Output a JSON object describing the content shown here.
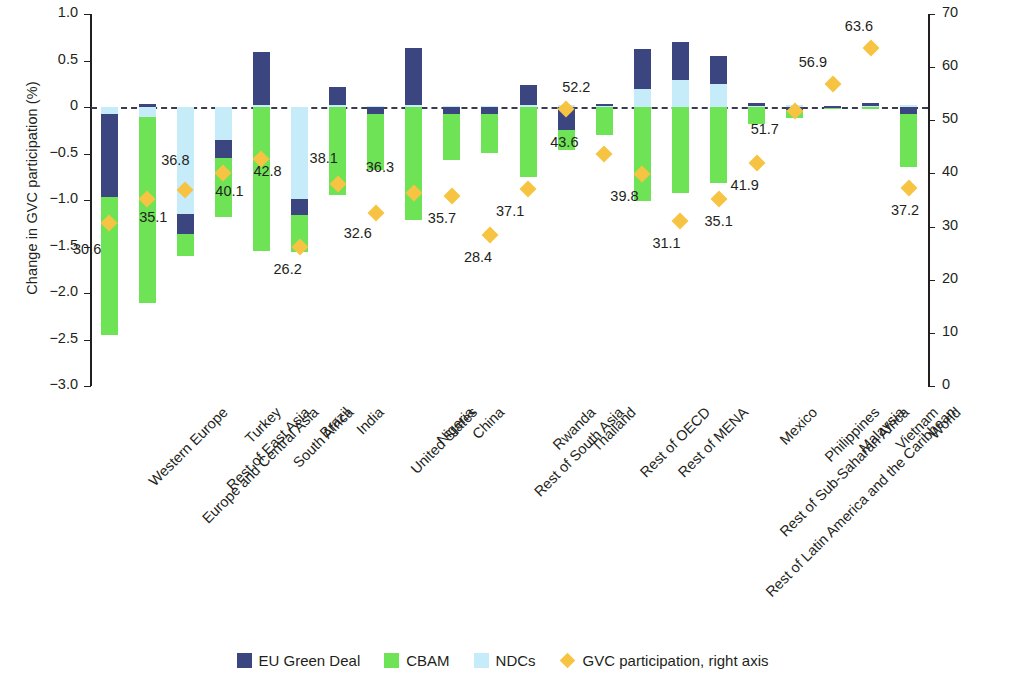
{
  "chart_data": {
    "type": "bar",
    "title": "",
    "subtitle": "",
    "ylabel": "Change in GVC participation (%)",
    "ylabel_right": "GVC participation, by country and region (%)",
    "xlabel": "",
    "ylim": [
      -3.0,
      1.0
    ],
    "ylim_right": [
      0,
      70
    ],
    "yticks": [
      "1.0",
      "0.5",
      "0",
      "−0.5",
      "−1.0",
      "−1.5",
      "−2.0",
      "−2.5",
      "−3.0"
    ],
    "ytick_values": [
      1.0,
      0.5,
      0,
      -0.5,
      -1.0,
      -1.5,
      -2.0,
      -2.5,
      -3.0
    ],
    "yticks_right": [
      "70",
      "60",
      "50",
      "40",
      "30",
      "20",
      "10",
      "0"
    ],
    "ytick_values_right": [
      70,
      60,
      50,
      40,
      30,
      20,
      10,
      0
    ],
    "grid": false,
    "zero_line": true,
    "legend_position": "bottom",
    "stacked": true,
    "categories": [
      "Western Europe",
      "Europe and Central Asia",
      "Rest of East Asia",
      "Turkey",
      "South Africa",
      "Brazil",
      "India",
      "United States",
      "Nigeria",
      "China",
      "Rest of South Asia",
      "Rwanda",
      "Thailand",
      "Rest of OECD",
      "Rest of MENA",
      "Rest of Latin America and the Caribbean",
      "Rest of Sub-Saharan Africa",
      "Mexico",
      "Philippines",
      "Malaysia",
      "Vietnam",
      "World"
    ],
    "series": [
      {
        "name": "EU Green Deal",
        "color": "#3b4680",
        "values": [
          -0.9,
          0.03,
          -0.22,
          -0.19,
          0.57,
          -0.17,
          0.19,
          -0.08,
          0.61,
          -0.08,
          -0.08,
          0.22,
          -0.25,
          0.02,
          0.43,
          0.41,
          0.3,
          0.03,
          -0.03,
          0.01,
          0.03,
          -0.07
        ]
      },
      {
        "name": "CBAM",
        "color": "#6ee356",
        "values": [
          -1.48,
          -2.0,
          -0.23,
          -0.63,
          -1.55,
          -0.4,
          -0.95,
          -0.6,
          -1.22,
          -0.49,
          -0.41,
          -0.75,
          -0.21,
          -0.3,
          -1.01,
          -0.93,
          -0.82,
          -0.18,
          -0.09,
          -0.01,
          -0.02,
          -0.58
        ]
      },
      {
        "name": "NDCs",
        "color": "#c6ecfa",
        "values": [
          -0.07,
          -0.11,
          -1.15,
          -0.36,
          0.02,
          -0.99,
          0.02,
          0.01,
          0.02,
          0.01,
          0.01,
          0.02,
          0.02,
          0.01,
          0.19,
          0.29,
          0.25,
          0.01,
          0.02,
          -0.01,
          0.01,
          0.02
        ]
      }
    ],
    "marker_series": {
      "name": "GVC participation, right axis",
      "color": "#f6c442",
      "axis": "right",
      "values": [
        30.6,
        35.1,
        36.8,
        40.1,
        42.8,
        26.2,
        38.1,
        32.6,
        36.3,
        35.7,
        28.4,
        37.1,
        52.2,
        43.6,
        39.8,
        31.1,
        35.1,
        41.9,
        51.7,
        56.9,
        63.6,
        37.2
      ]
    },
    "marker_labels": [
      "30.6",
      "35.1",
      "36.8",
      "40.1",
      "42.8",
      "26.2",
      "38.1",
      "32.6",
      "36.3",
      "35.7",
      "28.4",
      "37.1",
      "52.2",
      "43.6",
      "39.8",
      "31.1",
      "35.1",
      "41.9",
      "51.7",
      "56.9",
      "63.6",
      "37.2"
    ]
  },
  "legend": {
    "items": [
      {
        "label": "EU Green Deal",
        "color": "#3b4680",
        "shape": "square"
      },
      {
        "label": "CBAM",
        "color": "#6ee356",
        "shape": "square"
      },
      {
        "label": "NDCs",
        "color": "#c6ecfa",
        "shape": "square"
      },
      {
        "label": "GVC participation, right axis",
        "color": "#f6c442",
        "shape": "diamond"
      }
    ]
  },
  "colors": {
    "eu_green_deal": "#3b4680",
    "cbam": "#6ee356",
    "ndcs": "#c6ecfa",
    "gvc_marker": "#f6c442",
    "axis": "#231f20",
    "zero_line": "#3b3b4f"
  }
}
